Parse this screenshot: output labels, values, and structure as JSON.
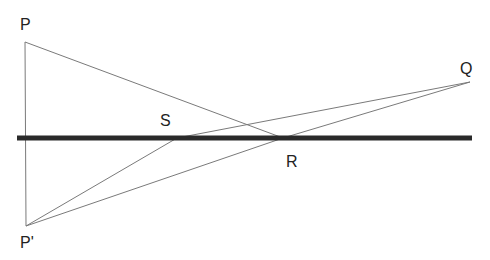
{
  "diagram": {
    "colors": {
      "thin_line": "#7a7a7a",
      "thick_line": "#2a2a2a",
      "label": "#222222"
    },
    "points": {
      "P": {
        "label": "P",
        "x": 25,
        "y": 42
      },
      "P_prime": {
        "label": "P'",
        "x": 26,
        "y": 226
      },
      "Q": {
        "label": "Q",
        "x": 470,
        "y": 82
      },
      "R": {
        "label": "R",
        "x": 283,
        "y": 138
      },
      "S": {
        "label": "S",
        "x": 177,
        "y": 138
      }
    },
    "surface_line": {
      "x1": 17,
      "y1": 138,
      "x2": 472,
      "y2": 138
    },
    "segments": [
      {
        "from": "P",
        "to": "P_prime"
      },
      {
        "from": "P",
        "to": "R"
      },
      {
        "from": "P_prime",
        "to": "R"
      },
      {
        "from": "R",
        "to": "Q"
      },
      {
        "from": "P_prime",
        "to": "S"
      },
      {
        "from": "S",
        "to": "Q"
      }
    ]
  }
}
